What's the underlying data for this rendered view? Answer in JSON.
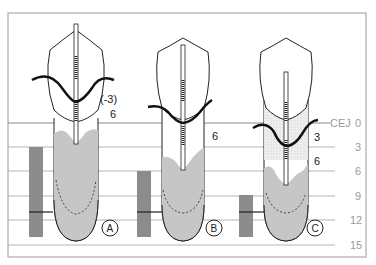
{
  "figure": {
    "scale": {
      "reference_label": "CEJ",
      "ticks": [
        "0",
        "3",
        "6",
        "9",
        "12",
        "15"
      ]
    },
    "teeth": [
      {
        "id": "A",
        "label": "A",
        "annotations": [
          "(-3)",
          "6"
        ]
      },
      {
        "id": "B",
        "label": "B",
        "annotations": [
          "6"
        ]
      },
      {
        "id": "C",
        "label": "C",
        "annotations": [
          "3",
          "6"
        ]
      }
    ],
    "colors": {
      "bone": "#c4c4c4",
      "bar": "#8c8c8c",
      "grid": "#b0b0b0",
      "frame": "#9a9a9a",
      "outline": "#222222"
    }
  }
}
